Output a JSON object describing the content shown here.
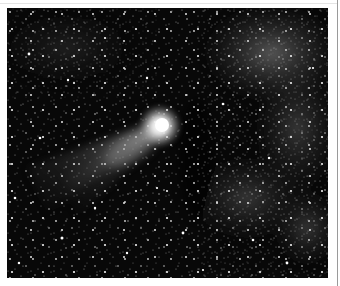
{
  "image": {
    "subject": "Comet with tail against a dense starfield and Milky Way cloud",
    "alt": "Black-and-white astrophotograph of a comet",
    "colors": {
      "sky": "#080808",
      "comet_head": "#ffffff",
      "milky_way": "#5a5a5a",
      "page": "#ffffff",
      "border": "#9a9a9a"
    }
  }
}
